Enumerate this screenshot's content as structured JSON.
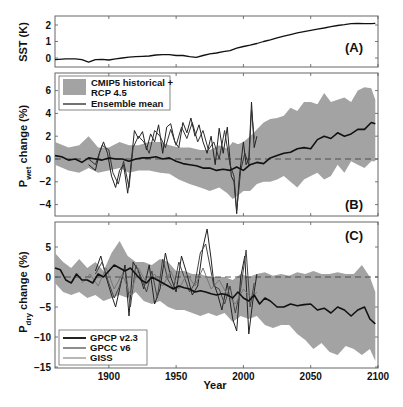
{
  "figure": {
    "xlabel": "Year",
    "x_ticks": [
      1900,
      1950,
      2000,
      2050,
      2100
    ],
    "xlim": [
      1860,
      2100
    ]
  },
  "chart_data": [
    {
      "type": "line",
      "panel": "(A)",
      "title": "",
      "xlabel": "Year",
      "ylabel": "SST (K)",
      "ylim": [
        -0.5,
        2.5
      ],
      "y_ticks": [
        0,
        1,
        2
      ],
      "grid": false,
      "series": [
        {
          "name": "SST",
          "color": "#111111",
          "x": [
            1860,
            1868,
            1875,
            1880,
            1885,
            1890,
            1895,
            1900,
            1905,
            1910,
            1915,
            1920,
            1925,
            1930,
            1935,
            1940,
            1945,
            1950,
            1955,
            1960,
            1965,
            1970,
            1975,
            1980,
            1985,
            1990,
            1995,
            2000,
            2005,
            2010,
            2015,
            2020,
            2025,
            2030,
            2035,
            2040,
            2045,
            2050,
            2055,
            2060,
            2065,
            2070,
            2075,
            2080,
            2085,
            2090,
            2095,
            2098
          ],
          "values": [
            -0.1,
            -0.05,
            -0.05,
            -0.1,
            -0.25,
            -0.1,
            -0.08,
            -0.12,
            -0.05,
            0.0,
            0.05,
            0.08,
            0.1,
            0.12,
            0.18,
            0.2,
            0.2,
            0.15,
            0.15,
            0.08,
            0.04,
            0.15,
            0.25,
            0.3,
            0.38,
            0.45,
            0.6,
            0.7,
            0.78,
            0.88,
            1.0,
            1.1,
            1.22,
            1.32,
            1.42,
            1.52,
            1.6,
            1.68,
            1.75,
            1.82,
            1.9,
            1.97,
            2.02,
            2.08,
            2.1,
            2.08,
            2.08,
            2.1
          ]
        }
      ]
    },
    {
      "type": "line",
      "panel": "(B)",
      "title": "",
      "xlabel": "Year",
      "ylabel": "P_wet change (%)",
      "ylabel_main": "P",
      "ylabel_sub": "wet",
      "ylabel_rest": " change (%)",
      "ylim": [
        -5,
        7.5
      ],
      "y_ticks": [
        -4,
        -2,
        0,
        2,
        4,
        6
      ],
      "grid": false,
      "legend_position": "upper left",
      "legend": [
        "CMIP5 historical +",
        "RCP 4.5",
        "Ensemble mean"
      ],
      "band": {
        "name": "CMIP5 historical + RCP 4.5",
        "color": "#a3a3a3",
        "x": [
          1860,
          1870,
          1878,
          1885,
          1892,
          1900,
          1908,
          1915,
          1922,
          1930,
          1938,
          1945,
          1952,
          1960,
          1968,
          1975,
          1982,
          1988,
          1992,
          1996,
          2000,
          2005,
          2010,
          2015,
          2020,
          2025,
          2030,
          2035,
          2040,
          2045,
          2050,
          2055,
          2060,
          2065,
          2070,
          2075,
          2080,
          2085,
          2090,
          2095,
          2098
        ],
        "upper": [
          1.5,
          1.0,
          1.2,
          2.0,
          1.0,
          1.0,
          1.5,
          1.2,
          1.2,
          1.5,
          1.5,
          1.2,
          1.0,
          1.0,
          0.8,
          0.8,
          1.2,
          0.9,
          1.5,
          1.3,
          1.5,
          2.0,
          2.6,
          3.2,
          3.5,
          3.6,
          3.8,
          4.5,
          4.2,
          5.0,
          5.0,
          4.8,
          5.8,
          5.0,
          5.2,
          5.4,
          5.0,
          6.0,
          6.3,
          6.2,
          5.2
        ],
        "lower": [
          -0.5,
          -1.0,
          -1.2,
          -0.8,
          -1.2,
          -1.0,
          -0.8,
          -1.2,
          -1.0,
          -1.0,
          -1.2,
          -1.3,
          -1.8,
          -2.2,
          -2.5,
          -2.8,
          -2.5,
          -3.0,
          -3.5,
          -3.2,
          -2.8,
          -2.8,
          -2.2,
          -2.0,
          -2.0,
          -1.8,
          -1.5,
          -2.0,
          -2.5,
          -1.8,
          -1.5,
          -1.2,
          -1.8,
          -1.5,
          -0.5,
          -1.2,
          -0.2,
          -0.5,
          -0.8,
          -0.2,
          -0.2
        ]
      },
      "series": [
        {
          "name": "Ensemble mean",
          "color": "#111111",
          "width": 1.6,
          "x": [
            1860,
            1865,
            1870,
            1875,
            1880,
            1885,
            1890,
            1895,
            1900,
            1905,
            1910,
            1915,
            1920,
            1925,
            1930,
            1935,
            1940,
            1945,
            1950,
            1955,
            1960,
            1965,
            1970,
            1975,
            1980,
            1985,
            1990,
            1995,
            2000,
            2005,
            2010,
            2015,
            2020,
            2025,
            2030,
            2035,
            2040,
            2045,
            2050,
            2055,
            2060,
            2065,
            2070,
            2075,
            2080,
            2085,
            2090,
            2095,
            2098
          ],
          "values": [
            0.3,
            0.2,
            -0.1,
            0.0,
            -0.3,
            0.1,
            0.0,
            -0.1,
            0.1,
            0.0,
            0.0,
            -0.2,
            0.0,
            0.1,
            0.1,
            0.2,
            0.0,
            0.1,
            -0.2,
            -0.4,
            -0.5,
            -0.6,
            -0.8,
            -0.8,
            -1.0,
            -0.9,
            -1.0,
            -0.7,
            -1.0,
            -0.5,
            -0.3,
            -0.4,
            0.1,
            0.3,
            0.5,
            0.6,
            0.9,
            1.0,
            0.9,
            1.7,
            2.0,
            1.8,
            2.3,
            2.0,
            2.2,
            2.6,
            2.6,
            3.2,
            3.1
          ]
        },
        {
          "name": "GPCP v2.3 / GPCC v6 / GISS (observations)",
          "color": "#222222",
          "width": 1.0,
          "x": [
            1885,
            1890,
            1893,
            1896,
            1899,
            1902,
            1905,
            1908,
            1911,
            1914,
            1916,
            1919,
            1922,
            1925,
            1928,
            1931,
            1934,
            1937,
            1940,
            1943,
            1946,
            1949,
            1952,
            1955,
            1958,
            1961,
            1964,
            1967,
            1970,
            1973,
            1976,
            1979,
            1982,
            1985,
            1988,
            1991,
            1993,
            1995,
            1997,
            2000,
            2002,
            2004,
            2006,
            2008,
            2010
          ],
          "values": [
            -0.5,
            -1.0,
            0.5,
            1.5,
            0.5,
            -1.5,
            -2.5,
            -1.0,
            -0.5,
            -3.0,
            -1.0,
            2.5,
            1.8,
            2.4,
            0.8,
            2.2,
            1.5,
            3.0,
            0.5,
            2.8,
            3.1,
            1.5,
            1.0,
            3.2,
            2.3,
            3.6,
            2.0,
            3.0,
            1.5,
            0.5,
            2.0,
            -0.5,
            2.7,
            0.5,
            2.8,
            -1.5,
            -2.0,
            -4.8,
            -1.5,
            1.5,
            -0.5,
            0.0,
            5.0,
            1.0,
            2.0
          ]
        },
        {
          "name": "obs secondary",
          "color": "#333333",
          "width": 1.0,
          "x": [
            1885,
            1890,
            1895,
            1900,
            1903,
            1907,
            1911,
            1915,
            1918,
            1922,
            1926,
            1930,
            1934,
            1938,
            1942,
            1946,
            1950,
            1954,
            1958,
            1962,
            1966,
            1970,
            1974,
            1978,
            1982,
            1986,
            1990,
            1993,
            1995,
            1998,
            2001,
            2004,
            2006,
            2008
          ],
          "values": [
            0.0,
            -0.5,
            1.2,
            0.8,
            -1.2,
            -2.2,
            -0.2,
            -2.5,
            1.0,
            2.0,
            1.5,
            0.5,
            2.5,
            2.0,
            1.0,
            2.6,
            1.2,
            2.8,
            1.8,
            3.2,
            1.5,
            2.5,
            0.8,
            1.5,
            0.0,
            2.5,
            -0.5,
            -1.5,
            -4.5,
            -1.0,
            0.5,
            -0.5,
            4.3,
            1.8
          ]
        }
      ]
    },
    {
      "type": "line",
      "panel": "(C)",
      "title": "",
      "xlabel": "Year",
      "ylabel": "P_dry change (%)",
      "ylabel_main": "P",
      "ylabel_sub": "dry",
      "ylabel_rest": " change (%)",
      "ylim": [
        -15,
        9
      ],
      "y_ticks": [
        -15,
        -10,
        -5,
        0,
        5
      ],
      "grid": false,
      "legend_position": "lower left",
      "legend": [
        "GPCP v2.3",
        "GPCC v6",
        "GISS"
      ],
      "band": {
        "name": "CMIP5 historical + RCP 4.5",
        "color": "#a3a3a3",
        "x": [
          1860,
          1866,
          1872,
          1878,
          1884,
          1890,
          1896,
          1902,
          1908,
          1914,
          1920,
          1926,
          1932,
          1938,
          1944,
          1950,
          1956,
          1962,
          1968,
          1974,
          1980,
          1986,
          1992,
          1998,
          2004,
          2010,
          2016,
          2022,
          2028,
          2034,
          2040,
          2046,
          2052,
          2058,
          2064,
          2070,
          2076,
          2082,
          2088,
          2094,
          2098
        ],
        "upper": [
          4.0,
          2.5,
          1.5,
          3.0,
          1.5,
          2.5,
          1.0,
          4.0,
          6.0,
          3.5,
          2.5,
          2.5,
          2.0,
          3.0,
          2.5,
          1.0,
          1.0,
          0.5,
          0.5,
          0.0,
          0.0,
          0.0,
          -0.5,
          0.5,
          0.0,
          0.5,
          0.8,
          0.2,
          0.5,
          0.2,
          0.8,
          0.5,
          1.0,
          0.5,
          0.5,
          0.8,
          0.5,
          0.5,
          2.0,
          0.0,
          -2.5
        ],
        "lower": [
          -1.0,
          -2.5,
          -3.0,
          -2.5,
          -3.5,
          -3.0,
          -4.0,
          -3.5,
          -3.0,
          -3.5,
          -2.5,
          -4.0,
          -4.5,
          -4.0,
          -5.0,
          -5.5,
          -5.5,
          -6.0,
          -6.5,
          -6.0,
          -6.5,
          -6.0,
          -7.5,
          -6.5,
          -7.0,
          -6.5,
          -8.0,
          -8.5,
          -8.0,
          -8.0,
          -9.5,
          -10.5,
          -12.0,
          -11.0,
          -12.5,
          -13.0,
          -11.5,
          -12.0,
          -13.0,
          -12.0,
          -14.0
        ]
      },
      "series": [
        {
          "name": "Ensemble mean",
          "color": "#111111",
          "width": 1.6,
          "x": [
            1860,
            1864,
            1868,
            1872,
            1876,
            1880,
            1884,
            1888,
            1892,
            1896,
            1900,
            1904,
            1908,
            1912,
            1916,
            1920,
            1924,
            1928,
            1932,
            1936,
            1940,
            1944,
            1948,
            1952,
            1956,
            1960,
            1964,
            1968,
            1972,
            1976,
            1980,
            1984,
            1988,
            1992,
            1996,
            2000,
            2004,
            2008,
            2012,
            2016,
            2020,
            2025,
            2030,
            2035,
            2040,
            2045,
            2050,
            2055,
            2060,
            2065,
            2070,
            2075,
            2080,
            2085,
            2090,
            2094,
            2098
          ],
          "values": [
            1.5,
            1.2,
            -0.5,
            -1.0,
            0.5,
            -0.5,
            -0.5,
            -1.0,
            0.5,
            0.0,
            1.0,
            2.0,
            1.5,
            1.0,
            1.5,
            0.5,
            -0.5,
            -1.0,
            0.0,
            -0.5,
            -1.0,
            -1.5,
            -2.0,
            -1.5,
            -1.8,
            -2.0,
            -2.5,
            -2.3,
            -2.5,
            -2.8,
            -3.0,
            -2.8,
            -3.0,
            -3.5,
            -2.5,
            -3.5,
            -4.0,
            -3.0,
            -4.5,
            -3.5,
            -4.0,
            -5.0,
            -5.0,
            -4.5,
            -4.8,
            -4.6,
            -4.5,
            -5.5,
            -5.2,
            -6.0,
            -5.0,
            -5.5,
            -6.5,
            -5.5,
            -5.0,
            -7.0,
            -7.8
          ]
        },
        {
          "name": "GPCP v2.3",
          "color": "#222222",
          "width": 1.0,
          "x": [
            1890,
            1894,
            1898,
            1902,
            1905,
            1908,
            1912,
            1915,
            1918,
            1922,
            1926,
            1930,
            1934,
            1938,
            1942,
            1946,
            1950,
            1954,
            1958,
            1962,
            1966,
            1970,
            1973,
            1976,
            1978,
            1981,
            1984,
            1988,
            1992,
            1995,
            1998,
            2001,
            2004,
            2007,
            2010
          ],
          "values": [
            1.0,
            3.5,
            0.0,
            -3.0,
            -5.0,
            -2.0,
            2.0,
            -6.5,
            2.5,
            1.0,
            -2.0,
            2.0,
            -4.5,
            -2.0,
            4.0,
            0.0,
            -2.5,
            3.5,
            0.5,
            -3.0,
            -1.5,
            5.0,
            8.0,
            3.0,
            -1.0,
            -3.0,
            -5.5,
            -1.0,
            -7.0,
            -9.0,
            0.0,
            3.5,
            -9.5,
            -4.0,
            0.5
          ]
        },
        {
          "name": "GPCC v6",
          "color": "#444444",
          "width": 1.0,
          "x": [
            1890,
            1895,
            1900,
            1904,
            1908,
            1912,
            1916,
            1920,
            1924,
            1928,
            1932,
            1936,
            1940,
            1944,
            1948,
            1952,
            1956,
            1960,
            1964,
            1968,
            1972,
            1975,
            1978,
            1982,
            1986,
            1990,
            1994,
            1998,
            2002,
            2005,
            2008
          ],
          "values": [
            0.5,
            2.5,
            -1.0,
            -3.5,
            -1.5,
            1.5,
            -5.0,
            2.0,
            0.0,
            -2.5,
            1.0,
            -3.5,
            3.0,
            -0.5,
            -2.0,
            2.5,
            0.0,
            -2.5,
            -1.0,
            4.0,
            5.5,
            2.0,
            -1.5,
            -2.0,
            -4.5,
            -1.5,
            -6.0,
            -2.0,
            4.5,
            -5.0,
            -1.0
          ]
        },
        {
          "name": "GISS",
          "color": "#777777",
          "width": 1.0,
          "x": [
            1880,
            1886,
            1892,
            1898,
            1904,
            1910,
            1916,
            1922,
            1928,
            1934,
            1940,
            1946,
            1952,
            1958,
            1964,
            1970,
            1976,
            1982,
            1988,
            1994,
            2000,
            2006,
            2010
          ],
          "values": [
            -1.0,
            0.5,
            -1.5,
            1.5,
            -2.0,
            0.5,
            -3.0,
            1.5,
            -1.0,
            0.5,
            -1.5,
            1.0,
            -2.0,
            0.5,
            -1.5,
            1.5,
            -2.0,
            -0.5,
            -3.0,
            -4.5,
            -2.0,
            -3.5,
            -2.5
          ]
        }
      ]
    }
  ],
  "panels": {
    "a": {
      "label": "(A)",
      "ylabel": "SST (K)"
    },
    "b": {
      "label": "(B)",
      "ylabel_main": "P",
      "ylabel_sub": "wet",
      "ylabel_rest": " change (%)",
      "legend": {
        "band_label_1": "CMIP5 historical +",
        "band_label_2": "RCP 4.5",
        "mean_label": "Ensemble mean"
      }
    },
    "c": {
      "label": "(C)",
      "ylabel_main": "P",
      "ylabel_sub": "dry",
      "ylabel_rest": " change (%)",
      "legend": {
        "items": [
          "GPCP v2.3",
          "GPCC v6",
          "GISS"
        ]
      }
    }
  },
  "colors": {
    "band": "#a3a3a3",
    "mean": "#111111",
    "axis": "#555555",
    "zero_dash": "#444444"
  }
}
